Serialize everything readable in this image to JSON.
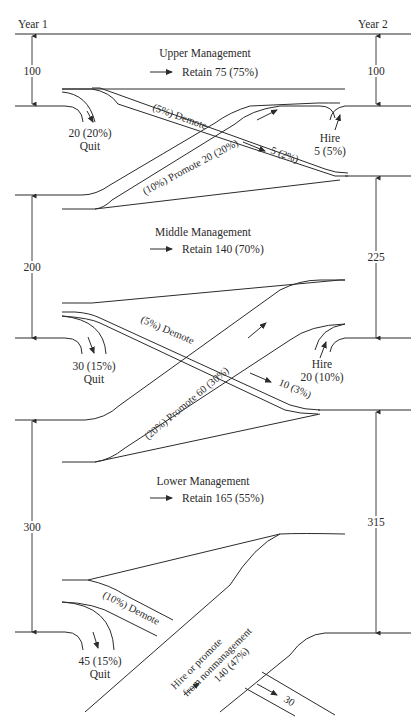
{
  "diagram": {
    "type": "manpower-flow",
    "columns": {
      "left": "Year 1",
      "right": "Year 2"
    },
    "levels": [
      {
        "id": "upper",
        "title": "Upper Management",
        "year1": "100",
        "year2": "100",
        "retain": "Retain 75 (75%)",
        "quit": {
          "value": "20 (20%)",
          "label": "Quit"
        },
        "hire": {
          "label": "Hire",
          "value": "5 (5%)"
        },
        "demote_label": "(5%) Demote",
        "demote_value": "5 (2%)"
      },
      {
        "id": "middle",
        "title": "Middle Management",
        "year1": "200",
        "year2": "225",
        "retain": "Retain 140 (70%)",
        "quit": {
          "value": "30 (15%)",
          "label": "Quit"
        },
        "hire": {
          "label": "Hire",
          "value": "20 (10%)"
        },
        "promote_label": "(10%) Promote 20 (20%)",
        "demote_label": "(5%) Demote",
        "demote_value": "10 (3%)"
      },
      {
        "id": "lower",
        "title": "Lower Management",
        "year1": "300",
        "year2": "315",
        "retain": "Retain 165 (55%)",
        "quit": {
          "value": "45 (15%)",
          "label": "Quit"
        },
        "promote_label": "(20%) Promote 60 (30%)",
        "demote_label": "(10%) Demote",
        "demote_value": "30",
        "hire_nonmgmt": {
          "line1": "Hire or promote",
          "line2": "from nonmanagement",
          "value": "140 (47%)"
        }
      }
    ],
    "colors": {
      "ink": "#2b2b2b",
      "background": "#ffffff"
    }
  }
}
